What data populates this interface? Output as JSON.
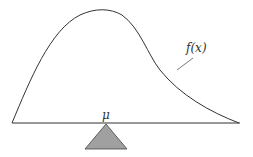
{
  "diagram": {
    "curve_label": "f(x)",
    "mean_label": "μ",
    "colors": {
      "line": "#333333",
      "fulcrum_fill": "#a0a0a0",
      "fulcrum_stroke": "#444444",
      "background": "#ffffff"
    }
  }
}
